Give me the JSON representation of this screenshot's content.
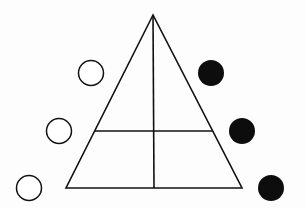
{
  "diagram": {
    "title": "",
    "colors": {
      "background": "#fdfdfd",
      "stroke": "#111111",
      "filled": "#0d0d0d",
      "open": "#ffffff"
    },
    "triangle": {
      "apex": [
        153,
        15
      ],
      "base_left": [
        66,
        188
      ],
      "base_right": [
        242,
        188
      ],
      "vertical_divider": {
        "from": [
          153,
          15
        ],
        "to": [
          154,
          188
        ]
      },
      "horizontal_divider": {
        "from": [
          95,
          131
        ],
        "to": [
          212,
          131
        ]
      }
    },
    "open_circles": [
      {
        "cx": 91,
        "cy": 73,
        "r": 12.5
      },
      {
        "cx": 59,
        "cy": 131,
        "r": 12.5
      },
      {
        "cx": 29,
        "cy": 188,
        "r": 12.5
      }
    ],
    "filled_circles": [
      {
        "cx": 211,
        "cy": 73,
        "r": 13
      },
      {
        "cx": 242,
        "cy": 131,
        "r": 13
      },
      {
        "cx": 271,
        "cy": 188,
        "r": 13
      }
    ]
  }
}
